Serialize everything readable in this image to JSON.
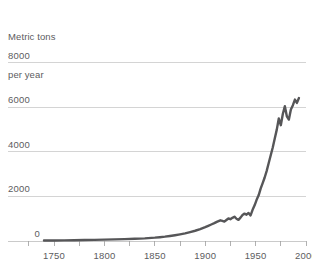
{
  "chart_data": {
    "type": "line",
    "title": "",
    "subtitle": "",
    "ylabel_line1": "Metric tons",
    "ylabel_line2": "per year",
    "xlabel": "",
    "xlim": [
      1740,
      2000
    ],
    "ylim": [
      0,
      8800
    ],
    "grid": true,
    "legend": "none",
    "y_ticks": [
      {
        "value": 8000,
        "label": "8000"
      },
      {
        "value": 6000,
        "label": "6000"
      },
      {
        "value": 4000,
        "label": "4000"
      },
      {
        "value": 2000,
        "label": "2000"
      },
      {
        "value": 0,
        "label": "0"
      }
    ],
    "x_ticks_major": [
      {
        "value": 1750,
        "label": "1750"
      },
      {
        "value": 1800,
        "label": "1800"
      },
      {
        "value": 1850,
        "label": "1850"
      },
      {
        "value": 1900,
        "label": "1900"
      },
      {
        "value": 1950,
        "label": "1950"
      },
      {
        "value": 2000,
        "label": "2000"
      }
    ],
    "x_ticks_minor": [
      1725,
      1775,
      1825,
      1875,
      1925,
      1975
    ],
    "series": [
      {
        "name": "Production",
        "color": "#565658",
        "x": [
          1740,
          1750,
          1760,
          1770,
          1780,
          1790,
          1800,
          1810,
          1820,
          1830,
          1840,
          1850,
          1855,
          1860,
          1865,
          1870,
          1875,
          1880,
          1885,
          1890,
          1895,
          1900,
          1903,
          1906,
          1909,
          1912,
          1915,
          1917,
          1919,
          1921,
          1923,
          1925,
          1927,
          1929,
          1931,
          1933,
          1935,
          1937,
          1939,
          1941,
          1943,
          1945,
          1947,
          1949,
          1951,
          1953,
          1955,
          1957,
          1959,
          1961,
          1963,
          1965,
          1967,
          1969,
          1971,
          1973,
          1975,
          1977,
          1979,
          1981,
          1983,
          1985,
          1987,
          1989,
          1991,
          1993
        ],
        "y": [
          20,
          25,
          30,
          35,
          42,
          50,
          60,
          72,
          85,
          100,
          120,
          150,
          170,
          195,
          225,
          260,
          300,
          345,
          400,
          460,
          530,
          620,
          680,
          740,
          800,
          870,
          930,
          900,
          870,
          940,
          1010,
          980,
          1040,
          1090,
          1000,
          950,
          1050,
          1170,
          1230,
          1180,
          1260,
          1150,
          1400,
          1600,
          1850,
          2050,
          2350,
          2600,
          2850,
          3150,
          3500,
          3850,
          4200,
          4600,
          5000,
          5500,
          5200,
          5700,
          6050,
          5600,
          5450,
          5900,
          6100,
          6350,
          6200,
          6420
        ]
      }
    ]
  },
  "accent_colors": {
    "line": "#565658",
    "gridline": "#c9c9c9",
    "text": "#5c5c5e",
    "background": "#ffffff"
  }
}
